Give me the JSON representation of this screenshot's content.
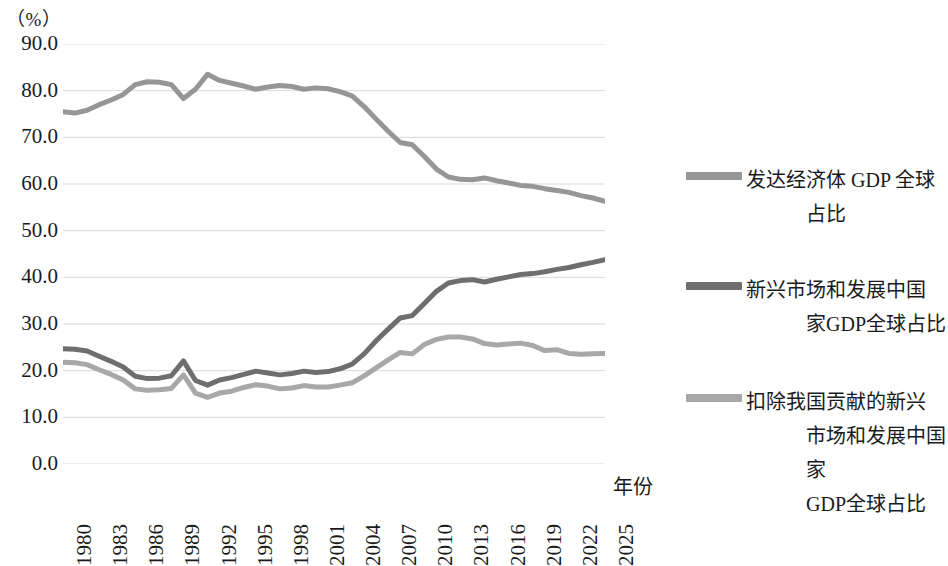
{
  "chart_data": {
    "type": "line",
    "title": "",
    "xlabel": "年份",
    "ylabel": "（%）",
    "ylim": [
      0,
      90
    ],
    "ytick_step": 10,
    "grid": true,
    "legend_position": "right",
    "x": [
      1980,
      1981,
      1982,
      1983,
      1984,
      1985,
      1986,
      1987,
      1988,
      1989,
      1990,
      1991,
      1992,
      1993,
      1994,
      1995,
      1996,
      1997,
      1998,
      1999,
      2000,
      2001,
      2002,
      2003,
      2004,
      2005,
      2006,
      2007,
      2008,
      2009,
      2010,
      2011,
      2012,
      2013,
      2014,
      2015,
      2016,
      2017,
      2018,
      2019,
      2020,
      2021,
      2022,
      2023,
      2024,
      2025
    ],
    "xtick_labels": [
      "1980",
      "1983",
      "1986",
      "1989",
      "1992",
      "1995",
      "1998",
      "2001",
      "2004",
      "2007",
      "2010",
      "2013",
      "2016",
      "2019",
      "2022",
      "2025"
    ],
    "ytick_labels": [
      "90.0",
      "80.0",
      "70.0",
      "60.0",
      "50.0",
      "40.0",
      "30.0",
      "20.0",
      "10.0",
      "0.0"
    ],
    "series": [
      {
        "name": "发达经济体 GDP 全球占比",
        "color": "#969696",
        "values": [
          75.5,
          75.2,
          75.8,
          77.0,
          78.0,
          79.2,
          81.3,
          81.9,
          81.8,
          81.3,
          78.3,
          80.3,
          83.5,
          82.2,
          81.6,
          81.0,
          80.3,
          80.8,
          81.1,
          80.9,
          80.3,
          80.6,
          80.4,
          79.8,
          78.9,
          76.6,
          73.9,
          71.3,
          68.9,
          68.4,
          65.9,
          63.2,
          61.5,
          61.0,
          60.9,
          61.3,
          60.7,
          60.2,
          59.7,
          59.5,
          59.0,
          58.6,
          58.2,
          57.5,
          57.0,
          56.3
        ]
      },
      {
        "name": "新兴市场和发展中国家GDP全球占比",
        "color": "#6e6e6e",
        "values": [
          24.7,
          24.6,
          24.2,
          23.1,
          22.0,
          20.8,
          18.8,
          18.3,
          18.4,
          18.9,
          22.1,
          17.9,
          16.9,
          18.0,
          18.5,
          19.2,
          19.9,
          19.5,
          19.1,
          19.4,
          19.9,
          19.6,
          19.8,
          20.4,
          21.4,
          23.6,
          26.4,
          28.9,
          31.3,
          31.8,
          34.4,
          37.0,
          38.8,
          39.3,
          39.5,
          39.0,
          39.6,
          40.1,
          40.6,
          40.8,
          41.2,
          41.7,
          42.1,
          42.7,
          43.2,
          43.8
        ]
      },
      {
        "name": "扣除我国贡献的新兴市场和发展中国家GDP全球占比",
        "color": "#a8a8a8",
        "values": [
          21.8,
          21.7,
          21.3,
          20.2,
          19.2,
          18.0,
          16.1,
          15.8,
          15.9,
          16.2,
          19.1,
          15.2,
          14.3,
          15.2,
          15.6,
          16.4,
          17.0,
          16.7,
          16.1,
          16.3,
          16.8,
          16.5,
          16.5,
          16.9,
          17.4,
          18.9,
          20.6,
          22.3,
          23.9,
          23.6,
          25.6,
          26.7,
          27.2,
          27.2,
          26.8,
          25.8,
          25.5,
          25.7,
          25.9,
          25.4,
          24.3,
          24.5,
          23.7,
          23.5,
          23.6,
          23.7
        ]
      }
    ]
  },
  "axis": {
    "unit_label": "（%）",
    "x_title": "年份"
  },
  "legend": {
    "items": [
      {
        "label": "发达经济体 GDP 全球",
        "label2": "占比",
        "label3": "",
        "swatch_color": "#969696",
        "swatch_name": "legend-swatch-developed"
      },
      {
        "label": "新兴市场和发展中国",
        "label2": "家GDP全球占比",
        "label3": "",
        "swatch_color": "#6e6e6e",
        "swatch_name": "legend-swatch-emerging"
      },
      {
        "label": "扣除我国贡献的新兴",
        "label2": "市场和发展中国家",
        "label3": "GDP全球占比",
        "swatch_color": "#a8a8a8",
        "swatch_name": "legend-swatch-emerging-ex-china"
      }
    ]
  }
}
